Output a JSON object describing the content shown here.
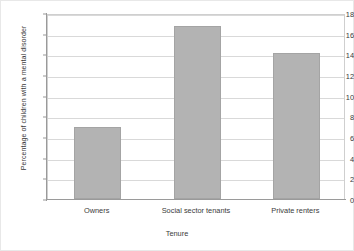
{
  "chart_data": {
    "type": "bar",
    "title": "",
    "subtitle": "",
    "categories": [
      "Owners",
      "Social sector tenants",
      "Private renters"
    ],
    "values": [
      7.0,
      16.7,
      14.1
    ],
    "xlabel": "Tenure",
    "ylabel": "Percentage of children with a mental disorder",
    "ylim": [
      0,
      18
    ],
    "ytick_values": [
      0,
      2,
      4,
      6,
      8,
      10,
      12,
      14,
      16,
      18
    ],
    "ytick_labels": [
      "0",
      "2",
      "4",
      "6",
      "8",
      "10",
      "12",
      "14",
      "16",
      "18"
    ],
    "grid": "horizontal",
    "legend": "none",
    "bar_color": "#b3b3b3",
    "bar_edge_color": "#a4a4a4",
    "gridline_color": "#d9d9d9",
    "axis_color": "#9a9a9a",
    "text_color": "#3a3a3a",
    "background_color": "#ffffff",
    "annotations": []
  }
}
